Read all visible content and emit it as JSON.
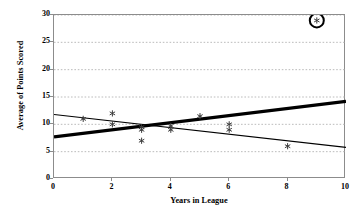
{
  "chart_data": {
    "type": "scatter",
    "title": "",
    "xlabel": "Years in League",
    "ylabel": "Average of Points Scored",
    "xlim": [
      0,
      10
    ],
    "ylim": [
      0,
      30
    ],
    "xticks": [
      0,
      2,
      4,
      6,
      8,
      10
    ],
    "yticks": [
      0,
      5,
      10,
      15,
      20,
      25,
      30
    ],
    "grid": "horizontal-dotted",
    "legend": "none",
    "points": [
      {
        "x": 1,
        "y": 11,
        "marker": "asterisk",
        "highlighted": false
      },
      {
        "x": 2,
        "y": 12,
        "marker": "asterisk",
        "highlighted": false
      },
      {
        "x": 2,
        "y": 10,
        "marker": "asterisk",
        "highlighted": false
      },
      {
        "x": 3,
        "y": 9.5,
        "marker": "asterisk",
        "highlighted": false
      },
      {
        "x": 3,
        "y": 9,
        "marker": "asterisk",
        "highlighted": false
      },
      {
        "x": 3,
        "y": 7,
        "marker": "asterisk",
        "highlighted": false
      },
      {
        "x": 4,
        "y": 9.7,
        "marker": "asterisk",
        "highlighted": false
      },
      {
        "x": 4,
        "y": 9,
        "marker": "asterisk",
        "highlighted": false
      },
      {
        "x": 5,
        "y": 11.5,
        "marker": "asterisk",
        "highlighted": false
      },
      {
        "x": 6,
        "y": 10,
        "marker": "asterisk",
        "highlighted": false
      },
      {
        "x": 6,
        "y": 9,
        "marker": "asterisk",
        "highlighted": false
      },
      {
        "x": 8,
        "y": 6,
        "marker": "asterisk",
        "highlighted": false
      },
      {
        "x": 9,
        "y": 29,
        "marker": "asterisk",
        "highlighted": true
      }
    ],
    "trend_lines": [
      {
        "name": "thick-rising-line",
        "style": "thick",
        "color": "#000000",
        "width_px": 3.2,
        "x_start": 0,
        "y_start": 7.7,
        "x_end": 10,
        "y_end": 14.2
      },
      {
        "name": "thin-falling-line",
        "style": "thin",
        "color": "#000000",
        "width_px": 1.2,
        "x_start": 0,
        "y_start": 11.8,
        "x_end": 10,
        "y_end": 5.8
      }
    ],
    "annotations": [
      {
        "name": "outlier-circle",
        "shape": "circle-outline",
        "x": 9,
        "y": 29,
        "radius_px": 7,
        "stroke_width_px": 2,
        "color": "#000000"
      }
    ],
    "colors": {
      "axis": "#8c8c8c",
      "grid": "#b4b4b4",
      "marker": "#3c3c3c",
      "line": "#000000"
    }
  },
  "axis_labels": {
    "y_title": "Average of Points Scored",
    "x_title": "Years in League",
    "y_tick_labels": [
      "0",
      "5",
      "10",
      "15",
      "20",
      "25",
      "30"
    ],
    "x_tick_labels": [
      "0",
      "2",
      "4",
      "6",
      "8",
      "10"
    ]
  }
}
